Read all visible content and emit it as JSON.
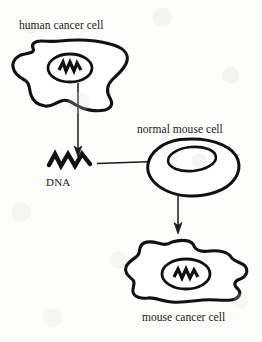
{
  "figure": {
    "background_color": "#fdfdfc",
    "ink_color": "#111111"
  },
  "labels": {
    "human_cancer_cell": "human cancer cell",
    "normal_mouse_cell": "normal mouse cell",
    "dna": "DNA",
    "mouse_cancer_cell": "mouse cancer cell"
  },
  "elements": {
    "human_cancer_cell": {
      "name": "human cancer cell",
      "shape": "irregular amoeboid blob",
      "nucleus": "ellipse containing zigzag DNA",
      "bounds": [
        12,
        40,
        128,
        112
      ]
    },
    "dna_fragment": {
      "name": "DNA",
      "shape": "thick zigzag stroke",
      "bounds": [
        48,
        152,
        94,
        170
      ]
    },
    "normal_mouse_cell": {
      "name": "normal mouse cell",
      "shape": "smooth oval",
      "nucleus": "smaller inner oval, empty",
      "bounds": [
        145,
        138,
        240,
        196
      ]
    },
    "mouse_cancer_cell": {
      "name": "mouse cancer cell",
      "shape": "lobed wavy blob",
      "nucleus": "ellipse containing zigzag DNA",
      "bounds": [
        125,
        240,
        248,
        305
      ]
    }
  },
  "arrows": [
    {
      "name": "arrow-human-nucleus-to-dna",
      "direction": "down",
      "from": "human cancer cell nucleus",
      "to": "DNA",
      "from_point": [
        78,
        83
      ],
      "to_point": [
        78,
        156
      ]
    },
    {
      "name": "arrow-dna-to-mouse-nucleus",
      "direction": "right",
      "from": "DNA",
      "to": "normal mouse cell nucleus",
      "from_point": [
        97,
        163
      ],
      "to_point": [
        174,
        161
      ]
    },
    {
      "name": "arrow-mouse-cell-to-cancer-cell",
      "direction": "down",
      "from": "normal mouse cell",
      "to": "mouse cancer cell",
      "from_point": [
        178,
        194
      ],
      "to_point": [
        178,
        234
      ]
    }
  ]
}
